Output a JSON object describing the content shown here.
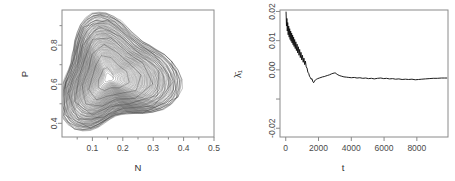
{
  "figure": {
    "panels": [
      "phase-portrait",
      "lyapunov-running-mean"
    ]
  },
  "chart_data": [
    {
      "id": "phase-portrait",
      "type": "line",
      "title": "",
      "xlabel": "N",
      "ylabel": "P",
      "xlim": [
        0.0,
        0.5
      ],
      "ylim": [
        0.33,
        0.98
      ],
      "grid": false,
      "legend": null,
      "xticks": [
        0.1,
        0.2,
        0.3,
        0.4,
        0.5
      ],
      "xticklabels": [
        "0.1",
        "0.2",
        "0.3",
        "0.4",
        "0.5"
      ],
      "yticks": [
        0.4,
        0.6,
        0.8
      ],
      "yticklabels": [
        "0.4",
        "0.6",
        "0.8"
      ],
      "y_minor_ticks": [
        0.5,
        0.7,
        0.9
      ],
      "x_minor_ticks": [
        0.05,
        0.15,
        0.25,
        0.35,
        0.45
      ],
      "description": "Chaotic predator-prey attractor: outward spiral of ~70 nested rounded-triangular loops",
      "center": [
        0.152,
        0.632
      ],
      "loops": 70,
      "r_inner": [
        0.012,
        0.022
      ],
      "r_outer": [
        0.175,
        0.295
      ],
      "annotations": []
    },
    {
      "id": "lyapunov-running-mean",
      "type": "line",
      "title": "",
      "xlabel": "t",
      "ylabel": "λ̄₁",
      "xlim": [
        -350,
        9900
      ],
      "ylim": [
        -0.023,
        0.0205
      ],
      "grid": false,
      "legend": null,
      "xticks": [
        0,
        2000,
        4000,
        6000,
        8000
      ],
      "xticklabels": [
        "0",
        "2000",
        "4000",
        "6000",
        "8000"
      ],
      "yticks": [
        0.02,
        0.01,
        0.0,
        -0.01,
        -0.02
      ],
      "yticklabels": [
        "0.02",
        "0.01",
        "0.00",
        "",
        "-0.02"
      ],
      "zero_reference": 0.0,
      "asymptote": -0.0032,
      "series": [
        {
          "name": "running mean of largest Lyapunov exponent",
          "x": [
            20,
            45,
            70,
            95,
            120,
            150,
            180,
            210,
            240,
            270,
            300,
            330,
            360,
            390,
            420,
            450,
            480,
            510,
            545,
            580,
            615,
            650,
            690,
            730,
            770,
            810,
            850,
            890,
            930,
            975,
            1020,
            1065,
            1110,
            1155,
            1200,
            1250,
            1300,
            1350,
            1400,
            1450,
            1500,
            1550,
            1600,
            1650,
            1700,
            1760,
            1820,
            1880,
            1950,
            2050,
            2150,
            2250,
            2350,
            2450,
            2560,
            2670,
            2780,
            2880,
            2960,
            3010,
            3080,
            3180,
            3300,
            3420,
            3550,
            3700,
            3850,
            4000,
            4180,
            4350,
            4520,
            4700,
            4880,
            5050,
            5230,
            5400,
            5600,
            5800,
            5980,
            6150,
            6330,
            6520,
            6700,
            6900,
            7100,
            7300,
            7500,
            7700,
            7900,
            8100,
            8300,
            8520,
            8750,
            9000,
            9250,
            9500,
            9700,
            9850
          ],
          "y": [
            0.0198,
            0.015,
            0.0176,
            0.0133,
            0.0162,
            0.012,
            0.015,
            0.0112,
            0.0141,
            0.0104,
            0.0133,
            0.0098,
            0.0126,
            0.0092,
            0.0119,
            0.0086,
            0.0112,
            0.008,
            0.0104,
            0.0073,
            0.0096,
            0.0066,
            0.0088,
            0.0058,
            0.0079,
            0.005,
            0.007,
            0.0042,
            0.006,
            0.0034,
            0.005,
            0.0026,
            0.004,
            0.0018,
            0.003,
            0.001,
            0.0006,
            -0.0008,
            -0.0012,
            -0.0022,
            -0.0026,
            -0.0032,
            -0.003,
            -0.004,
            -0.0044,
            -0.0038,
            -0.0034,
            -0.0032,
            -0.003,
            -0.0028,
            -0.0026,
            -0.0024,
            -0.0023,
            -0.0021,
            -0.0019,
            -0.0017,
            -0.0014,
            -0.0012,
            -0.0011,
            -0.001,
            -0.0013,
            -0.0017,
            -0.002,
            -0.0022,
            -0.0024,
            -0.0025,
            -0.0026,
            -0.0027,
            -0.0026,
            -0.0028,
            -0.0027,
            -0.0029,
            -0.0028,
            -0.003,
            -0.0029,
            -0.0031,
            -0.0029,
            -0.0028,
            -0.003,
            -0.0029,
            -0.0031,
            -0.003,
            -0.0032,
            -0.0031,
            -0.0033,
            -0.0032,
            -0.0033,
            -0.0032,
            -0.0034,
            -0.0033,
            -0.0032,
            -0.0031,
            -0.003,
            -0.0029,
            -0.0029,
            -0.0028,
            -0.0028,
            -0.0028
          ]
        }
      ],
      "description": "Running mean of the dominant Lyapunov exponent; fast oscillating transient decays to a slightly negative plateau"
    }
  ]
}
